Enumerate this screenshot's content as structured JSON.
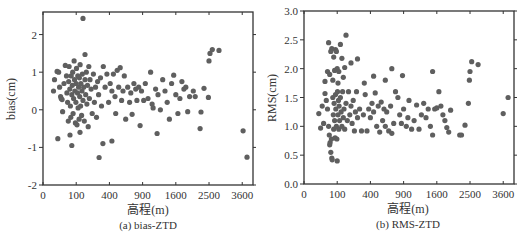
{
  "figure": {
    "dot_color": "#5f5f5f",
    "frame_color": "#333333"
  },
  "chart_data": [
    {
      "type": "scatter",
      "title": "",
      "caption": "(a) bias-ZTD",
      "xlabel": "高程(m)",
      "ylabel": "bias(cm)",
      "x_scale": "sqrt",
      "xlim": [
        0,
        4000
      ],
      "ylim": [
        -2,
        2.6
      ],
      "x_ticks": [
        0,
        100,
        400,
        900,
        1600,
        2500,
        3600
      ],
      "y_ticks": [
        -2,
        -1,
        0,
        1,
        2
      ],
      "grid": false,
      "legend": null,
      "points": [
        [
          145,
          2.43
        ],
        [
          160,
          1.47
        ],
        [
          285,
          -1.27
        ],
        [
          325,
          -0.9
        ],
        [
          430,
          -0.83
        ],
        [
          855,
          -0.42
        ],
        [
          1180,
          -0.63
        ],
        [
          20,
          -0.77
        ],
        [
          75,
          -0.95
        ],
        [
          66,
          -0.67
        ],
        [
          124,
          -0.6
        ],
        [
          3630,
          -0.56
        ],
        [
          3775,
          -1.26
        ],
        [
          2530,
          1.5
        ],
        [
          2600,
          1.6
        ],
        [
          2810,
          1.58
        ],
        [
          2500,
          1.3
        ],
        [
          2350,
          0.57
        ],
        [
          2480,
          0.33
        ],
        [
          2240,
          -0.5
        ],
        [
          2265,
          -0.06
        ],
        [
          10,
          0.5
        ],
        [
          12,
          0.8
        ],
        [
          18,
          1.02
        ],
        [
          22,
          1.0
        ],
        [
          25,
          0.6
        ],
        [
          28,
          0.35
        ],
        [
          30,
          0.3
        ],
        [
          33,
          0.27
        ],
        [
          35,
          -0.05
        ],
        [
          40,
          0.7
        ],
        [
          45,
          1.18
        ],
        [
          50,
          0.9
        ],
        [
          52,
          0.45
        ],
        [
          55,
          0.2
        ],
        [
          58,
          -0.3
        ],
        [
          60,
          0.75
        ],
        [
          62,
          1.15
        ],
        [
          65,
          0.55
        ],
        [
          68,
          0.1
        ],
        [
          70,
          -0.2
        ],
        [
          72,
          0.9
        ],
        [
          75,
          0.4
        ],
        [
          78,
          0.65
        ],
        [
          80,
          1.0
        ],
        [
          82,
          -0.1
        ],
        [
          85,
          0.3
        ],
        [
          88,
          1.3
        ],
        [
          90,
          0.8
        ],
        [
          92,
          0.5
        ],
        [
          95,
          -0.35
        ],
        [
          98,
          0.2
        ],
        [
          100,
          0.7
        ],
        [
          102,
          1.1
        ],
        [
          105,
          -0.4
        ],
        [
          108,
          0.45
        ],
        [
          110,
          0.9
        ],
        [
          112,
          0.05
        ],
        [
          115,
          0.6
        ],
        [
          118,
          -0.25
        ],
        [
          120,
          0.85
        ],
        [
          122,
          0.35
        ],
        [
          125,
          1.2
        ],
        [
          128,
          0.1
        ],
        [
          130,
          0.7
        ],
        [
          135,
          -0.15
        ],
        [
          138,
          0.5
        ],
        [
          140,
          0.95
        ],
        [
          145,
          0.25
        ],
        [
          150,
          0.6
        ],
        [
          155,
          -0.3
        ],
        [
          160,
          0.8
        ],
        [
          165,
          0.4
        ],
        [
          170,
          1.0
        ],
        [
          175,
          0.15
        ],
        [
          180,
          0.65
        ],
        [
          185,
          -0.45
        ],
        [
          190,
          1.15
        ],
        [
          195,
          0.3
        ],
        [
          200,
          0.8
        ],
        [
          210,
          0.55
        ],
        [
          220,
          -0.1
        ],
        [
          230,
          0.95
        ],
        [
          240,
          0.2
        ],
        [
          250,
          0.6
        ],
        [
          260,
          -0.2
        ],
        [
          270,
          0.75
        ],
        [
          280,
          0.4
        ],
        [
          300,
          0.85
        ],
        [
          310,
          0.1
        ],
        [
          330,
          1.15
        ],
        [
          350,
          0.6
        ],
        [
          370,
          0.95
        ],
        [
          390,
          0.2
        ],
        [
          410,
          0.7
        ],
        [
          430,
          0.5
        ],
        [
          450,
          0.95
        ],
        [
          470,
          0.35
        ],
        [
          480,
          -0.1
        ],
        [
          500,
          1.05
        ],
        [
          520,
          0.6
        ],
        [
          540,
          1.12
        ],
        [
          560,
          0.25
        ],
        [
          580,
          0.5
        ],
        [
          600,
          0.9
        ],
        [
          620,
          -0.25
        ],
        [
          650,
          0.6
        ],
        [
          680,
          0.2
        ],
        [
          700,
          0.45
        ],
        [
          720,
          -0.12
        ],
        [
          750,
          0.7
        ],
        [
          780,
          0.55
        ],
        [
          800,
          0.25
        ],
        [
          830,
          0.6
        ],
        [
          880,
          0.5
        ],
        [
          920,
          0.25
        ],
        [
          950,
          0.7
        ],
        [
          1000,
          0.3
        ],
        [
          1050,
          1.0
        ],
        [
          1080,
          0.15
        ],
        [
          1100,
          0.05
        ],
        [
          1150,
          0.55
        ],
        [
          1200,
          0.4
        ],
        [
          1250,
          0.0
        ],
        [
          1300,
          0.8
        ],
        [
          1350,
          0.5
        ],
        [
          1400,
          0.2
        ],
        [
          1450,
          -0.25
        ],
        [
          1500,
          0.7
        ],
        [
          1550,
          0.92
        ],
        [
          1600,
          0.4
        ],
        [
          1650,
          -0.1
        ],
        [
          1700,
          0.3
        ],
        [
          1750,
          0.75
        ],
        [
          1800,
          0.55
        ],
        [
          1850,
          0.6
        ],
        [
          1900,
          -0.05
        ],
        [
          1950,
          0.35
        ],
        [
          2050,
          0.5
        ],
        [
          2100,
          0.35
        ]
      ]
    },
    {
      "type": "scatter",
      "title": "",
      "caption": "(b) RMS-ZTD",
      "xlabel": "高程(m)",
      "ylabel": "RMS(cm)",
      "x_scale": "sqrt",
      "xlim": [
        0,
        4000
      ],
      "ylim": [
        0,
        3.0
      ],
      "x_ticks": [
        0,
        100,
        400,
        900,
        1600,
        2500,
        3600
      ],
      "y_ticks": [
        0.0,
        0.5,
        1.0,
        1.5,
        2.0,
        2.5,
        3.0
      ],
      "grid": false,
      "legend": null,
      "points": [
        [
          160,
          2.58
        ],
        [
          55,
          2.45
        ],
        [
          65,
          2.3
        ],
        [
          70,
          2.35
        ],
        [
          80,
          2.2
        ],
        [
          90,
          2.33
        ],
        [
          95,
          2.3
        ],
        [
          120,
          2.42
        ],
        [
          130,
          2.18
        ],
        [
          200,
          2.1
        ],
        [
          260,
          2.17
        ],
        [
          50,
          1.95
        ],
        [
          60,
          1.9
        ],
        [
          85,
          1.97
        ],
        [
          100,
          2.0
        ],
        [
          110,
          1.95
        ],
        [
          140,
          1.85
        ],
        [
          150,
          2.02
        ],
        [
          40,
          1.78
        ],
        [
          75,
          1.8
        ],
        [
          105,
          1.75
        ],
        [
          330,
          1.75
        ],
        [
          440,
          1.87
        ],
        [
          600,
          1.8
        ],
        [
          700,
          2.0
        ],
        [
          880,
          1.88
        ],
        [
          1500,
          1.95
        ],
        [
          2500,
          1.95
        ],
        [
          2550,
          2.12
        ],
        [
          2750,
          2.07
        ],
        [
          2480,
          1.8
        ],
        [
          20,
          1.22
        ],
        [
          25,
          0.97
        ],
        [
          30,
          1.35
        ],
        [
          35,
          1.05
        ],
        [
          40,
          1.57
        ],
        [
          45,
          1.45
        ],
        [
          50,
          1.3
        ],
        [
          55,
          1.0
        ],
        [
          58,
          0.85
        ],
        [
          60,
          0.68
        ],
        [
          62,
          0.72
        ],
        [
          65,
          0.55
        ],
        [
          68,
          0.78
        ],
        [
          70,
          0.45
        ],
        [
          72,
          0.42
        ],
        [
          75,
          1.5
        ],
        [
          78,
          1.2
        ],
        [
          80,
          0.95
        ],
        [
          82,
          1.4
        ],
        [
          85,
          1.1
        ],
        [
          88,
          0.8
        ],
        [
          90,
          1.55
        ],
        [
          92,
          1.3
        ],
        [
          95,
          1.0
        ],
        [
          98,
          0.78
        ],
        [
          100,
          0.4
        ],
        [
          102,
          1.6
        ],
        [
          105,
          1.2
        ],
        [
          108,
          1.45
        ],
        [
          110,
          0.95
        ],
        [
          112,
          1.35
        ],
        [
          115,
          1.1
        ],
        [
          120,
          1.5
        ],
        [
          125,
          1.25
        ],
        [
          130,
          1.0
        ],
        [
          135,
          1.6
        ],
        [
          140,
          1.15
        ],
        [
          145,
          1.3
        ],
        [
          150,
          0.95
        ],
        [
          160,
          1.4
        ],
        [
          170,
          1.1
        ],
        [
          180,
          1.6
        ],
        [
          190,
          1.2
        ],
        [
          200,
          1.35
        ],
        [
          210,
          1.05
        ],
        [
          220,
          1.45
        ],
        [
          230,
          0.92
        ],
        [
          240,
          1.25
        ],
        [
          250,
          1.6
        ],
        [
          260,
          1.15
        ],
        [
          280,
          1.3
        ],
        [
          300,
          0.92
        ],
        [
          320,
          1.2
        ],
        [
          340,
          1.55
        ],
        [
          360,
          0.92
        ],
        [
          380,
          1.3
        ],
        [
          400,
          1.15
        ],
        [
          420,
          1.4
        ],
        [
          440,
          1.25
        ],
        [
          460,
          1.58
        ],
        [
          480,
          1.0
        ],
        [
          500,
          1.35
        ],
        [
          520,
          0.9
        ],
        [
          540,
          1.42
        ],
        [
          560,
          1.1
        ],
        [
          580,
          1.3
        ],
        [
          600,
          1.0
        ],
        [
          620,
          1.25
        ],
        [
          650,
          0.92
        ],
        [
          680,
          1.35
        ],
        [
          700,
          0.88
        ],
        [
          730,
          1.05
        ],
        [
          760,
          1.6
        ],
        [
          800,
          1.5
        ],
        [
          830,
          1.2
        ],
        [
          860,
          1.05
        ],
        [
          900,
          1.3
        ],
        [
          950,
          1.0
        ],
        [
          980,
          1.15
        ],
        [
          1000,
          1.45
        ],
        [
          1050,
          0.95
        ],
        [
          1100,
          1.1
        ],
        [
          1150,
          1.37
        ],
        [
          1200,
          0.95
        ],
        [
          1250,
          1.2
        ],
        [
          1300,
          1.4
        ],
        [
          1350,
          1.15
        ],
        [
          1400,
          1.3
        ],
        [
          1450,
          1.0
        ],
        [
          1500,
          0.85
        ],
        [
          1550,
          1.3
        ],
        [
          1600,
          1.32
        ],
        [
          1650,
          1.6
        ],
        [
          1700,
          1.35
        ],
        [
          1750,
          1.2
        ],
        [
          1800,
          1.1
        ],
        [
          1850,
          0.98
        ],
        [
          1900,
          0.9
        ],
        [
          1950,
          1.28
        ],
        [
          2200,
          0.85
        ],
        [
          2250,
          0.85
        ],
        [
          2350,
          1.02
        ],
        [
          2450,
          1.4
        ],
        [
          3600,
          1.22
        ],
        [
          3780,
          1.5
        ]
      ]
    }
  ]
}
